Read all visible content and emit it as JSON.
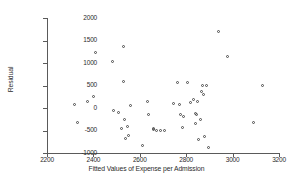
{
  "chart_data": {
    "type": "scatter",
    "title": "",
    "xlabel": "Fitted Values of Expense per Admission",
    "ylabel": "Residual",
    "xlim": [
      2200,
      3200
    ],
    "ylim": [
      -1000,
      2000
    ],
    "xticks": [
      2200,
      2400,
      2600,
      2800,
      3000,
      3200
    ],
    "yticks": [
      2000,
      1500,
      1000,
      500,
      0,
      -500,
      -1000
    ],
    "xtick_labels": [
      "2200",
      "2400",
      "2600",
      "2800",
      "3000",
      "3200"
    ],
    "ytick_labels": [
      "2000",
      "1500",
      "1000",
      "500",
      "0",
      "-500",
      "-1000"
    ],
    "grid": false,
    "legend": null,
    "marker": "open-circle",
    "marker_color": "#4a4a4a",
    "points": [
      {
        "x": 2318,
        "y": 70
      },
      {
        "x": 2330,
        "y": -320
      },
      {
        "x": 2375,
        "y": 155
      },
      {
        "x": 2400,
        "y": 250
      },
      {
        "x": 2410,
        "y": 1225
      },
      {
        "x": 2482,
        "y": 1030
      },
      {
        "x": 2487,
        "y": -60
      },
      {
        "x": 2510,
        "y": -95
      },
      {
        "x": 2520,
        "y": -445
      },
      {
        "x": 2528,
        "y": 1370
      },
      {
        "x": 2530,
        "y": 590
      },
      {
        "x": 2535,
        "y": -250
      },
      {
        "x": 2538,
        "y": -685
      },
      {
        "x": 2548,
        "y": -400
      },
      {
        "x": 2553,
        "y": -605
      },
      {
        "x": 2562,
        "y": 65
      },
      {
        "x": 2612,
        "y": -840
      },
      {
        "x": 2632,
        "y": 155
      },
      {
        "x": 2636,
        "y": -145
      },
      {
        "x": 2658,
        "y": -460
      },
      {
        "x": 2660,
        "y": -480
      },
      {
        "x": 2672,
        "y": -500
      },
      {
        "x": 2690,
        "y": -490
      },
      {
        "x": 2705,
        "y": -505
      },
      {
        "x": 2745,
        "y": 90
      },
      {
        "x": 2763,
        "y": 575
      },
      {
        "x": 2770,
        "y": 70
      },
      {
        "x": 2775,
        "y": -150
      },
      {
        "x": 2782,
        "y": -430
      },
      {
        "x": 2790,
        "y": -195
      },
      {
        "x": 2805,
        "y": 570
      },
      {
        "x": 2818,
        "y": 125
      },
      {
        "x": 2830,
        "y": 200
      },
      {
        "x": 2838,
        "y": -340
      },
      {
        "x": 2842,
        "y": -115
      },
      {
        "x": 2845,
        "y": -150
      },
      {
        "x": 2848,
        "y": 140
      },
      {
        "x": 2852,
        "y": -700
      },
      {
        "x": 2860,
        "y": -250
      },
      {
        "x": 2868,
        "y": 375
      },
      {
        "x": 2872,
        "y": 500
      },
      {
        "x": 2875,
        "y": 310
      },
      {
        "x": 2878,
        "y": -625
      },
      {
        "x": 2888,
        "y": 500
      },
      {
        "x": 2895,
        "y": -870
      },
      {
        "x": 2940,
        "y": 1690
      },
      {
        "x": 2978,
        "y": 1150
      },
      {
        "x": 3090,
        "y": -320
      },
      {
        "x": 3130,
        "y": 510
      }
    ]
  }
}
